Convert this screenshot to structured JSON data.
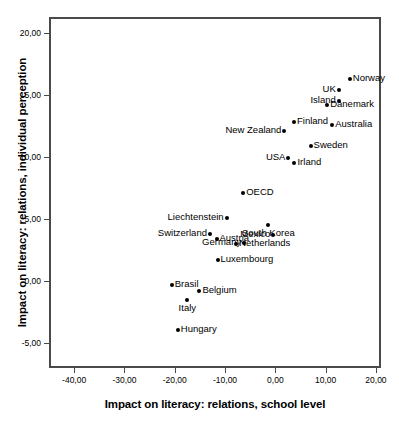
{
  "chart_data": {
    "type": "scatter",
    "title": "",
    "xlabel": "Impact on literacy: relations, school level",
    "ylabel": "Impact on literacy: relations, individual perception",
    "xlim": [
      -45.0,
      21.0
    ],
    "ylim": [
      -7.0,
      21.3
    ],
    "grid": false,
    "legend": "none",
    "xticks": [
      "-40,00",
      "-30,00",
      "-20,00",
      "-10,00",
      "0,00",
      "10,00",
      "20,00"
    ],
    "xtick_values": [
      -40,
      -30,
      -20,
      -10,
      0,
      10,
      20
    ],
    "yticks": [
      "20,00",
      "15,00",
      "10,00",
      "5,00",
      "0,00",
      "-5,00"
    ],
    "ytick_values": [
      20,
      15,
      10,
      5,
      0,
      -5
    ],
    "points": [
      {
        "label": "Norway",
        "x": 14.8,
        "y": 16.3,
        "label_pos": "right"
      },
      {
        "label": "UK",
        "x": 12.6,
        "y": 15.4,
        "label_pos": "left"
      },
      {
        "label": "Island",
        "x": 12.6,
        "y": 14.5,
        "label_pos": "left"
      },
      {
        "label": "Danemark",
        "x": 10.3,
        "y": 14.2,
        "label_pos": "right"
      },
      {
        "label": "Australia",
        "x": 11.3,
        "y": 12.6,
        "label_pos": "right"
      },
      {
        "label": "Finland",
        "x": 3.7,
        "y": 12.8,
        "label_pos": "right"
      },
      {
        "label": "New Zealand",
        "x": 1.8,
        "y": 12.1,
        "label_pos": "left"
      },
      {
        "label": "Sweden",
        "x": 7.0,
        "y": 10.9,
        "label_pos": "right"
      },
      {
        "label": "USA",
        "x": 2.6,
        "y": 9.9,
        "label_pos": "left"
      },
      {
        "label": "Irland",
        "x": 3.8,
        "y": 9.5,
        "label_pos": "right"
      },
      {
        "label": "OECD",
        "x": -6.4,
        "y": 7.1,
        "label_pos": "right"
      },
      {
        "label": "Liechtenstein",
        "x": -9.7,
        "y": 5.1,
        "label_pos": "left"
      },
      {
        "label": "South Korea",
        "x": -1.4,
        "y": 4.5,
        "label_pos": "below"
      },
      {
        "label": "Switzerland",
        "x": -13.0,
        "y": 3.8,
        "label_pos": "left"
      },
      {
        "label": "Mexico",
        "x": -0.4,
        "y": 3.7,
        "label_pos": "left"
      },
      {
        "label": "Austria",
        "x": -11.7,
        "y": 3.4,
        "label_pos": "right"
      },
      {
        "label": "Germany",
        "x": -6.2,
        "y": 3.1,
        "label_pos": "left"
      },
      {
        "label": "Netherlands",
        "x": -7.8,
        "y": 3.0,
        "label_pos": "right"
      },
      {
        "label": "Luxembourg",
        "x": -11.5,
        "y": 1.7,
        "label_pos": "right"
      },
      {
        "label": "Brasil",
        "x": -20.6,
        "y": -0.3,
        "label_pos": "right"
      },
      {
        "label": "Belgium",
        "x": -15.1,
        "y": -0.8,
        "label_pos": "right"
      },
      {
        "label": "Italy",
        "x": -17.5,
        "y": -1.5,
        "label_pos": "below"
      },
      {
        "label": "Hungary",
        "x": -19.4,
        "y": -3.9,
        "label_pos": "right"
      }
    ]
  }
}
